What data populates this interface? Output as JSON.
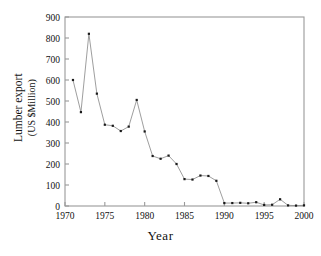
{
  "chart_data": {
    "type": "line",
    "title": "",
    "xlabel": "Year",
    "ylabel": "Lumber export (US $Million)",
    "ylabel_line1": "Lumber export",
    "ylabel_line2": "(US $Million)",
    "xlim": [
      1970,
      2000
    ],
    "ylim": [
      0,
      900
    ],
    "xticks": [
      1970,
      1975,
      1980,
      1985,
      1990,
      1995,
      2000
    ],
    "yticks": [
      0,
      100,
      200,
      300,
      400,
      500,
      600,
      700,
      800,
      900
    ],
    "xticklabels": [
      "1970",
      "1975",
      "1980",
      "1985",
      "1990",
      "1995",
      "2000"
    ],
    "yticklabels": [
      "0",
      "100",
      "200",
      "300",
      "400",
      "500",
      "600",
      "700",
      "800",
      "900"
    ],
    "grid": false,
    "legend": false,
    "frame": "box",
    "marker": "filled-square",
    "line_color": "#8c8c8c",
    "marker_color": "#1a1a1a",
    "axis_color": "#9a9a9a",
    "background": "#ffffff",
    "x": [
      1971,
      1972,
      1973,
      1974,
      1975,
      1976,
      1977,
      1978,
      1979,
      1980,
      1981,
      1982,
      1983,
      1984,
      1985,
      1986,
      1987,
      1988,
      1989,
      1990,
      1991,
      1992,
      1993,
      1994,
      1995,
      1996,
      1997,
      1998,
      1999,
      2000
    ],
    "values": [
      600,
      447,
      820,
      535,
      387,
      382,
      357,
      378,
      505,
      355,
      238,
      225,
      240,
      200,
      128,
      126,
      145,
      143,
      120,
      14,
      14,
      15,
      13,
      18,
      5,
      6,
      32,
      3,
      2,
      3
    ],
    "series": [
      {
        "name": "Lumber export",
        "values": [
          600,
          447,
          820,
          535,
          387,
          382,
          357,
          378,
          505,
          355,
          238,
          225,
          240,
          200,
          128,
          126,
          145,
          143,
          120,
          14,
          14,
          15,
          13,
          18,
          5,
          6,
          32,
          3,
          2,
          3
        ]
      }
    ]
  }
}
